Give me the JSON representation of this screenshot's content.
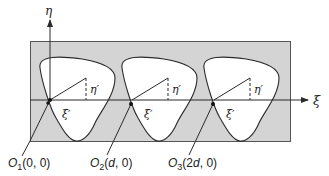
{
  "diagram": {
    "axes": {
      "vertical_label": "η",
      "horizontal_label": "ξ"
    },
    "cells": [
      {
        "local_vertical_label": "η′",
        "local_horizontal_label": "ξ′"
      },
      {
        "local_vertical_label": "η′",
        "local_horizontal_label": "ξ′"
      },
      {
        "local_vertical_label": "η′",
        "local_horizontal_label": "ξ′"
      }
    ],
    "origins": [
      {
        "name": "O",
        "sub": "1",
        "coords_open": "(0, 0)"
      },
      {
        "name": "O",
        "sub": "2",
        "coords_open": "(",
        "coords_italic": "d",
        "coords_close": ", 0)"
      },
      {
        "name": "O",
        "sub": "3",
        "coords_open": "(2",
        "coords_italic": "d",
        "coords_close": ", 0)"
      }
    ],
    "colors": {
      "background_region": "#d4d4d4",
      "cell_fill": "#ffffff",
      "stroke": "#2a2a2a"
    }
  }
}
